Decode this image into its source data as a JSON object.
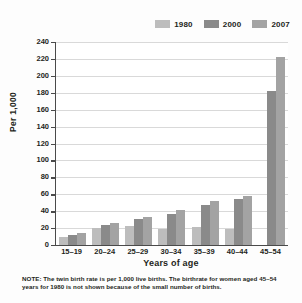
{
  "chart_data": {
    "type": "bar",
    "title": "",
    "xlabel": "Years of age",
    "ylabel": "Per 1,000",
    "ylim": [
      0,
      240
    ],
    "ytick_step": 20,
    "yticks": [
      240,
      220,
      200,
      180,
      160,
      140,
      120,
      100,
      80,
      60,
      40,
      20,
      0
    ],
    "grid": true,
    "legend_position": "top-right",
    "categories": [
      "15–19",
      "20–24",
      "25–29",
      "30–34",
      "35–39",
      "40–44",
      "45–54"
    ],
    "series": [
      {
        "name": "1980",
        "color": "#bdbdbd",
        "values": [
          10,
          20,
          22,
          19,
          21,
          19,
          null
        ]
      },
      {
        "name": "2000",
        "color": "#8a8a8a",
        "values": [
          12,
          24,
          31,
          37,
          47,
          54,
          182
        ]
      },
      {
        "name": "2007",
        "color": "#a3a3a3",
        "values": [
          14,
          26,
          33,
          41,
          52,
          58,
          222
        ]
      }
    ],
    "note": "NOTE: The twin birth rate is per 1,000 live births. The birthrate for women aged 45–54 years for 1980 is not shown because of the small number of births."
  },
  "legend": {
    "items": [
      {
        "label": "1980",
        "color": "#bdbdbd"
      },
      {
        "label": "2000",
        "color": "#8a8a8a"
      },
      {
        "label": "2007",
        "color": "#a3a3a3"
      }
    ]
  },
  "axes": {
    "y_title": "Per 1,000",
    "x_title": "Years of age"
  },
  "footnote": {
    "text": "NOTE: The twin birth rate is per 1,000 live births. The birthrate for women aged 45–54 years for 1980 is not shown because of the small number of births."
  }
}
